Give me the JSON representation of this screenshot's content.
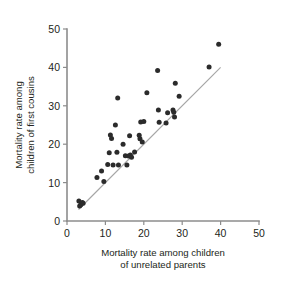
{
  "chart_data": {
    "type": "scatter",
    "title": "",
    "xlabel": "Mortality rate among children of unrelated parents",
    "xlabel_line1": "Mortality rate among children",
    "xlabel_line2": "of unrelated parents",
    "ylabel": "Mortality rate among children of first cousins",
    "ylabel_line1": "Mortality rate among",
    "ylabel_line2": "children of first cousins",
    "xlim": [
      0,
      50
    ],
    "ylim": [
      0,
      50
    ],
    "xticks": [
      0,
      10,
      20,
      30,
      40,
      50
    ],
    "yticks": [
      0,
      10,
      20,
      30,
      40,
      50
    ],
    "grid": false,
    "legend": false,
    "point_color": "#2b2b2b",
    "reference_line": {
      "label": "y = x identity line",
      "color": "#a6a6a6",
      "x": [
        3,
        40
      ],
      "y": [
        3,
        40
      ]
    },
    "points": [
      [
        3.1,
        5.2
      ],
      [
        3.3,
        3.9
      ],
      [
        3.6,
        4.2
      ],
      [
        4.0,
        4.8
      ],
      [
        4.2,
        4.6
      ],
      [
        7.8,
        11.3
      ],
      [
        9.0,
        13.0
      ],
      [
        9.6,
        10.3
      ],
      [
        10.6,
        14.7
      ],
      [
        11.0,
        17.8
      ],
      [
        11.3,
        22.4
      ],
      [
        11.6,
        21.5
      ],
      [
        12.0,
        14.6
      ],
      [
        12.6,
        25.0
      ],
      [
        13.0,
        17.9
      ],
      [
        13.2,
        32.0
      ],
      [
        13.4,
        14.6
      ],
      [
        14.6,
        20.0
      ],
      [
        15.2,
        17.0
      ],
      [
        15.6,
        14.6
      ],
      [
        16.0,
        16.9
      ],
      [
        16.3,
        22.2
      ],
      [
        16.5,
        17.2
      ],
      [
        16.8,
        16.6
      ],
      [
        17.6,
        18.0
      ],
      [
        18.8,
        22.3
      ],
      [
        19.0,
        21.4
      ],
      [
        19.2,
        25.8
      ],
      [
        19.6,
        20.6
      ],
      [
        20.0,
        25.9
      ],
      [
        20.8,
        33.4
      ],
      [
        23.6,
        39.2
      ],
      [
        23.8,
        28.9
      ],
      [
        24.0,
        25.7
      ],
      [
        25.8,
        25.5
      ],
      [
        26.2,
        28.2
      ],
      [
        27.6,
        28.9
      ],
      [
        27.8,
        28.3
      ],
      [
        28.0,
        27.1
      ],
      [
        28.2,
        35.9
      ],
      [
        29.2,
        32.5
      ],
      [
        37.0,
        40.1
      ],
      [
        39.5,
        46.0
      ]
    ]
  }
}
